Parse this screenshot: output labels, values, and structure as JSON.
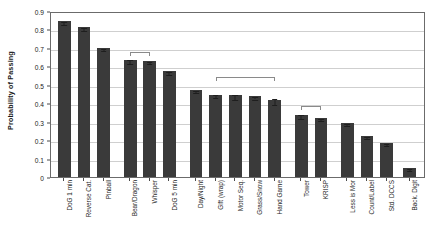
{
  "chart_data": {
    "type": "bar",
    "title": "",
    "xlabel": "",
    "ylabel": "Probability of Passing",
    "ylim": [
      0,
      0.9
    ],
    "ytick_labels": [
      "0.9",
      "0.8",
      "0.7",
      "0.6",
      "0.5",
      "0.4",
      "0.3",
      "0.2",
      "0.1",
      "0"
    ],
    "ytick_values": [
      0.9,
      0.8,
      0.7,
      0.6,
      0.5,
      0.4,
      0.3,
      0.2,
      0.1,
      0
    ],
    "grid": true,
    "legend": "none",
    "bar_color": "#3a3a3a",
    "categories": [
      "DoG 1 min",
      "Reverse Cat.",
      "Pinball",
      "Bear/Dragon",
      "Whisper",
      "DoG 5 min",
      "Day/Night",
      "Gift (wrap)",
      "Motor Seq.",
      "Grass/Snow",
      "Hand Game",
      "Tower",
      "KRISP",
      "Less is Mor",
      "Count/Label",
      "Std. DCCS",
      "Back. Digit"
    ],
    "values": [
      0.845,
      0.813,
      0.701,
      0.635,
      0.628,
      0.573,
      0.47,
      0.446,
      0.443,
      0.439,
      0.417,
      0.336,
      0.32,
      0.294,
      0.223,
      0.185,
      0.05
    ],
    "errors": [
      0.008,
      0.008,
      0.006,
      0.011,
      0.006,
      0.007,
      0.006,
      0.008,
      0.013,
      0.008,
      0.016,
      0.01,
      0.007,
      0.006,
      0.007,
      0.007,
      0.005
    ],
    "annotations": [
      {
        "label": "bracket-1",
        "from_index": 3,
        "to_index": 4,
        "y": 0.69
      },
      {
        "label": "bracket-2",
        "from_index": 7,
        "to_index": 10,
        "y": 0.553
      },
      {
        "label": "bracket-3",
        "from_index": 11,
        "to_index": 12,
        "y": 0.397
      }
    ]
  }
}
